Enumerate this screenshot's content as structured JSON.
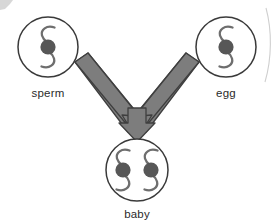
{
  "diagram": {
    "colors": {
      "background": "#ffffff",
      "circle_stroke": "#3a3a3a",
      "chromosome_stroke": "#6e6e6e",
      "centromere_fill": "#575757",
      "arrow_fill": "#7d7d7d",
      "arrow_stroke": "#3f3f3f",
      "label_text": "#2b2b2b",
      "scan_artifact": "#c9c9c9"
    },
    "cells": [
      {
        "id": "sperm",
        "label": "sperm",
        "cx": 48,
        "cy": 47,
        "r": 30,
        "chromosome_count": 1
      },
      {
        "id": "egg",
        "label": "egg",
        "cx": 226,
        "cy": 47,
        "r": 30,
        "chromosome_count": 1
      },
      {
        "id": "baby",
        "label": "baby",
        "cx": 137,
        "cy": 170,
        "r": 31,
        "chromosome_count": 2
      }
    ],
    "arrow": {
      "id": "merge-arrow",
      "shape": "y-merge-down",
      "from": [
        "sperm",
        "egg"
      ],
      "to": "baby"
    }
  }
}
